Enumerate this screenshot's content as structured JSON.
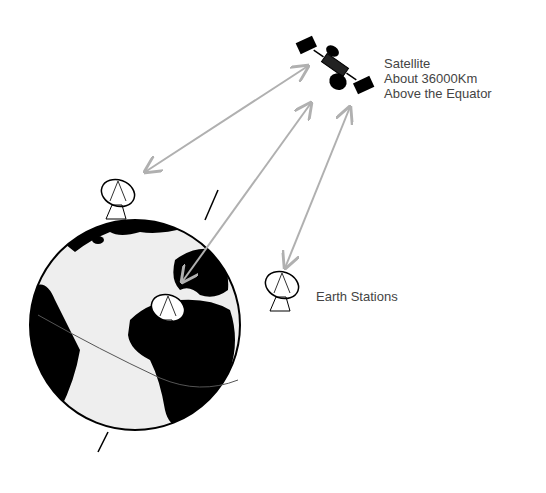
{
  "diagram": {
    "satellite": {
      "label_lines": [
        "Satellite",
        "About 36000Km",
        "Above the Equator"
      ]
    },
    "earth_stations": {
      "label": "Earth Stations",
      "count": 3
    },
    "links": [
      {
        "from": "earth-station-1",
        "to": "satellite",
        "type": "bidirectional"
      },
      {
        "from": "earth-station-2",
        "to": "satellite",
        "type": "bidirectional"
      },
      {
        "from": "earth-station-3",
        "to": "satellite",
        "type": "bidirectional"
      }
    ],
    "colors": {
      "arrow": "#b0b0b0",
      "land": "#000000",
      "ocean": "#eeeeee",
      "text": "#444444"
    }
  }
}
